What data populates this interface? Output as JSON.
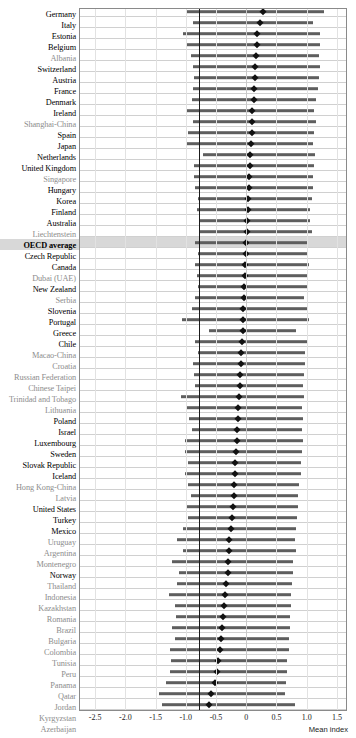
{
  "chart_data": {
    "type": "bar",
    "title": "",
    "xlabel": "Mean index",
    "ylabel": "",
    "xlim": [
      -2.75,
      1.65
    ],
    "xticks": [
      -2.5,
      -2.0,
      -1.5,
      -1.0,
      -0.5,
      0,
      0.5,
      1.0,
      1.5
    ],
    "xticklabels": [
      "-2.5",
      "-2.0",
      "-1.5",
      "-1.0",
      "-0.5",
      "0",
      "0.5",
      "1.0",
      "1.5"
    ],
    "grid": "vertical",
    "legend": "",
    "reference_line": -0.78,
    "marker": "diamond",
    "series_description": "Bars show range between bottom and top quarter of index distribution; diamond marks the mean index.",
    "categories": [
      "Germany",
      "Italy",
      "Estonia",
      "Belgium",
      "Albania",
      "Switzerland",
      "Austria",
      "France",
      "Denmark",
      "Ireland",
      "Shanghai-China",
      "Spain",
      "Japan",
      "Netherlands",
      "United Kingdom",
      "Singapore",
      "Hungary",
      "Korea",
      "Finland",
      "Australia",
      "Liechtenstein",
      "OECD average",
      "Czech Republic",
      "Canada",
      "Dubai (UAE)",
      "New Zealand",
      "Serbia",
      "Slovenia",
      "Portugal",
      "Greece",
      "Chile",
      "Macao-China",
      "Croatia",
      "Russian Federation",
      "Chinese Taipei",
      "Trinidad and Tobago",
      "Lithuania",
      "Poland",
      "Israel",
      "Luxembourg",
      "Sweden",
      "Slovak Republic",
      "Iceland",
      "Hong Kong-China",
      "Latvia",
      "United States",
      "Turkey",
      "Mexico",
      "Uruguay",
      "Argentina",
      "Montenegro",
      "Norway",
      "Thailand",
      "Indonesia",
      "Kazakhstan",
      "Romania",
      "Brazil",
      "Bulgaria",
      "Colombia",
      "Tunisia",
      "Peru",
      "Panama",
      "Qatar",
      "Jordan",
      "Kyrgyzstan",
      "Azerbaijan"
    ],
    "group": [
      "oecd",
      "oecd",
      "oecd",
      "oecd",
      "partner",
      "oecd",
      "oecd",
      "oecd",
      "oecd",
      "oecd",
      "partner",
      "oecd",
      "oecd",
      "oecd",
      "oecd",
      "partner",
      "oecd",
      "oecd",
      "oecd",
      "oecd",
      "partner",
      "average",
      "oecd",
      "oecd",
      "partner",
      "oecd",
      "partner",
      "oecd",
      "oecd",
      "oecd",
      "oecd",
      "partner",
      "partner",
      "partner",
      "partner",
      "partner",
      "partner",
      "oecd",
      "oecd",
      "oecd",
      "oecd",
      "oecd",
      "oecd",
      "partner",
      "partner",
      "oecd",
      "oecd",
      "oecd",
      "partner",
      "partner",
      "partner",
      "oecd",
      "partner",
      "partner",
      "partner",
      "partner",
      "partner",
      "partner",
      "partner",
      "partner",
      "partner",
      "partner",
      "partner",
      "partner",
      "partner",
      "partner"
    ],
    "mean_index": [
      0.28,
      0.22,
      0.18,
      0.18,
      0.16,
      0.15,
      0.14,
      0.13,
      0.12,
      0.1,
      0.1,
      0.09,
      0.08,
      0.07,
      0.06,
      0.05,
      0.04,
      0.03,
      0.03,
      0.02,
      0.01,
      0.0,
      -0.01,
      -0.02,
      -0.02,
      -0.03,
      -0.04,
      -0.05,
      -0.06,
      -0.06,
      -0.07,
      -0.08,
      -0.09,
      -0.1,
      -0.11,
      -0.12,
      -0.13,
      -0.14,
      -0.15,
      -0.16,
      -0.17,
      -0.18,
      -0.19,
      -0.2,
      -0.21,
      -0.22,
      -0.24,
      -0.26,
      -0.28,
      -0.29,
      -0.3,
      -0.31,
      -0.33,
      -0.35,
      -0.36,
      -0.38,
      -0.4,
      -0.42,
      -0.44,
      -0.46,
      -0.48,
      -0.52,
      -0.58,
      -0.62,
      -0.68,
      -0.7
    ],
    "range_low": [
      -1.0,
      -0.88,
      -1.05,
      -1.0,
      -0.92,
      -0.88,
      -0.86,
      -0.88,
      -0.9,
      -0.98,
      -0.88,
      -0.96,
      -0.98,
      -0.72,
      -0.86,
      -0.86,
      -0.84,
      -0.8,
      -0.82,
      -0.78,
      -0.76,
      -0.84,
      -0.8,
      -0.84,
      -0.82,
      -0.8,
      -0.84,
      -0.9,
      -1.06,
      -0.62,
      -0.84,
      -0.8,
      -0.88,
      -0.86,
      -0.84,
      -1.08,
      -1.0,
      -0.94,
      -0.9,
      -1.02,
      -1.02,
      -0.96,
      -1.02,
      -0.96,
      -0.92,
      -1.0,
      -0.96,
      -1.04,
      -1.14,
      -1.04,
      -1.22,
      -1.12,
      -1.14,
      -1.28,
      -1.18,
      -1.16,
      -1.22,
      -1.18,
      -1.26,
      -1.24,
      -1.26,
      -1.32,
      -1.44,
      -1.4,
      -1.52,
      -1.48
    ],
    "range_high": [
      1.28,
      1.1,
      1.22,
      1.22,
      1.2,
      1.22,
      1.2,
      1.18,
      1.16,
      1.12,
      1.16,
      1.12,
      1.1,
      1.14,
      1.12,
      1.1,
      1.1,
      1.08,
      1.06,
      1.06,
      1.08,
      1.02,
      1.0,
      1.04,
      1.02,
      1.0,
      0.96,
      1.0,
      1.04,
      0.82,
      1.0,
      0.98,
      0.98,
      0.96,
      0.94,
      0.96,
      0.92,
      0.94,
      0.92,
      0.94,
      0.92,
      0.9,
      0.9,
      0.88,
      0.86,
      0.86,
      0.84,
      0.82,
      0.8,
      0.82,
      0.78,
      0.78,
      0.76,
      0.74,
      0.74,
      0.72,
      0.72,
      0.7,
      0.7,
      0.68,
      0.68,
      0.66,
      0.64,
      0.8,
      0.62,
      0.66
    ]
  }
}
